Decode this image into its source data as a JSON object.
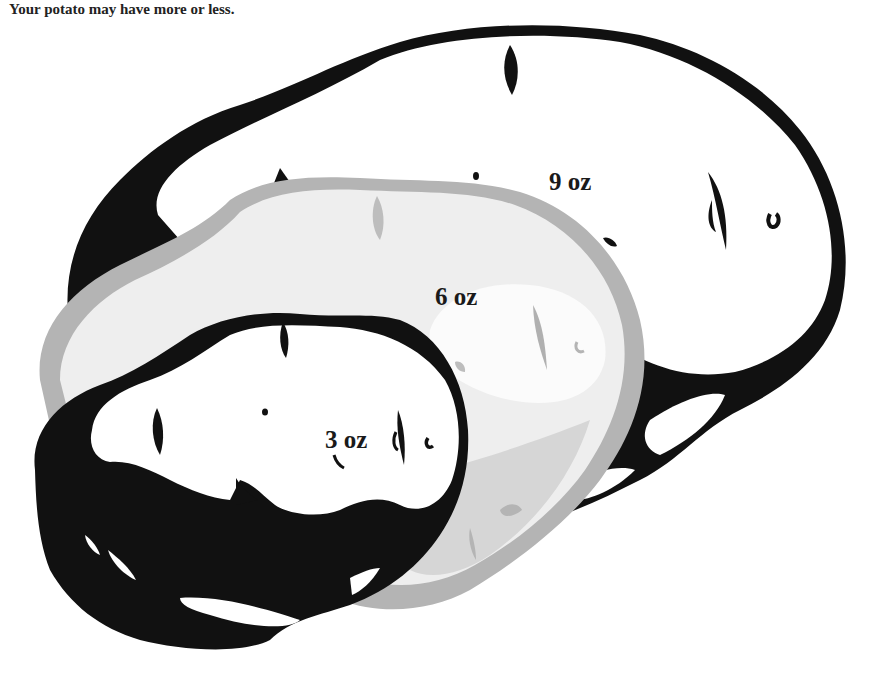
{
  "caption": {
    "line": "Your potato may have more or less."
  },
  "illustration": {
    "subject": "three-potatoes-size-comparison",
    "potatoes": [
      {
        "id": "large",
        "label": "9 oz",
        "fill": "#ffffff",
        "outline": "#111111"
      },
      {
        "id": "medium",
        "label": "6 oz",
        "fill": "#f2f2f2",
        "outline": "#a9a9a9"
      },
      {
        "id": "small",
        "label": "3 oz",
        "fill": "#ffffff",
        "outline": "#111111"
      }
    ],
    "colors": {
      "shadow": "#111111",
      "mid_gray": "#b4b4b4",
      "light_gray": "#dcdcdc",
      "highlight": "#fbfbfb"
    }
  }
}
